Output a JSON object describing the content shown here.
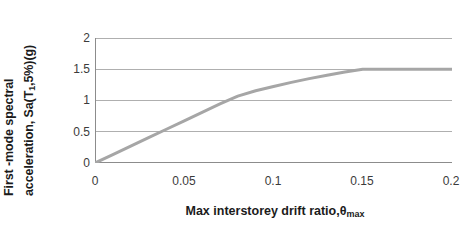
{
  "chart_data": {
    "type": "line",
    "title": "",
    "subtitle": "",
    "xlabel_text": "Max interstorey drift ratio,θ",
    "xlabel_sub": "max",
    "ylabel_line1": "First -mode spectral",
    "ylabel_line2_pre": "acceleration, Sa(T",
    "ylabel_line2_sub": "1",
    "ylabel_line2_post": ",5%)(g)",
    "xlim": [
      0,
      0.2
    ],
    "ylim": [
      0,
      2
    ],
    "xticks": [
      "0",
      "0.05",
      "0.1",
      "0.15",
      "0.2"
    ],
    "xtick_values": [
      0,
      0.05,
      0.1,
      0.15,
      0.2
    ],
    "yticks": [
      "0",
      "0.5",
      "1",
      "1.5",
      "2"
    ],
    "ytick_values": [
      0,
      0.5,
      1,
      1.5,
      2
    ],
    "grid": "horizontal",
    "legend": "none",
    "series": [
      {
        "name": "IDA capacity curve",
        "color": "#a6a6a6",
        "linewidth": 3,
        "x": [
          0.0,
          0.01,
          0.02,
          0.03,
          0.04,
          0.05,
          0.06,
          0.07,
          0.08,
          0.09,
          0.1,
          0.11,
          0.12,
          0.13,
          0.14,
          0.15,
          0.16,
          0.17,
          0.18,
          0.19,
          0.2
        ],
        "y": [
          0.0,
          0.135,
          0.27,
          0.405,
          0.54,
          0.675,
          0.81,
          0.945,
          1.07,
          1.155,
          1.225,
          1.29,
          1.35,
          1.405,
          1.455,
          1.5,
          1.5,
          1.5,
          1.5,
          1.5,
          1.5
        ]
      }
    ],
    "colors": {
      "curve": "#a6a6a6",
      "grid": "#9a9a9a",
      "axis": "#8c8c8c",
      "tick_text": "#3b3b3b",
      "label_text": "#1b1b1b",
      "background": "#ffffff"
    }
  }
}
